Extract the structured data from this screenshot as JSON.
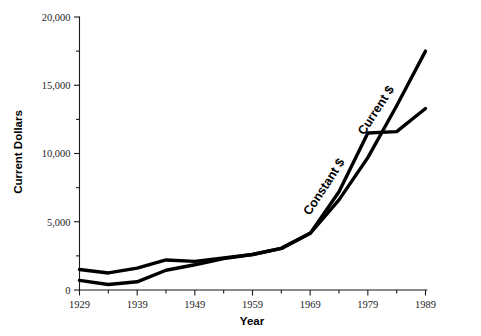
{
  "chart_data": {
    "type": "line",
    "title": "",
    "xlabel": "Year",
    "ylabel": "Current Dollars",
    "xlim": [
      1929,
      1989
    ],
    "ylim": [
      0,
      20000
    ],
    "grid": false,
    "legend_position": "inline-annotations",
    "x_ticks_major": [
      1929,
      1939,
      1949,
      1959,
      1969,
      1979,
      1989
    ],
    "x_ticks_major_labels": [
      "1929",
      "1939",
      "1949",
      "1959",
      "1969",
      "1979",
      "1989"
    ],
    "x_ticks_minor": [
      1934,
      1944,
      1954,
      1964,
      1974,
      1984
    ],
    "y_ticks_major": [
      0,
      5000,
      10000,
      15000,
      20000
    ],
    "y_ticks_major_labels": [
      "0",
      "5,000",
      "10,000",
      "15,000",
      "20,000"
    ],
    "y_ticks_minor": [
      2500,
      7500,
      12500,
      17500
    ],
    "series": [
      {
        "name": "Constant $",
        "label": "Constant $",
        "x": [
          1929,
          1934,
          1939,
          1944,
          1949,
          1954,
          1959,
          1964,
          1969,
          1974,
          1979,
          1984,
          1989
        ],
        "values": [
          1500,
          1250,
          1600,
          2200,
          2100,
          2350,
          2600,
          3050,
          4150,
          7200,
          11500,
          11600,
          13300
        ]
      },
      {
        "name": "Current $",
        "label": "Current $",
        "x": [
          1929,
          1934,
          1939,
          1944,
          1949,
          1954,
          1959,
          1964,
          1969,
          1974,
          1979,
          1984,
          1989
        ],
        "values": [
          700,
          400,
          600,
          1450,
          1850,
          2300,
          2600,
          3050,
          4150,
          6600,
          9700,
          13500,
          17500
        ]
      }
    ],
    "annotations": [
      {
        "text": "Constant $",
        "x": 1972,
        "y": 7400,
        "rotation": -57
      },
      {
        "text": "Current $",
        "x": 1981,
        "y": 13000,
        "rotation": -57
      }
    ]
  }
}
